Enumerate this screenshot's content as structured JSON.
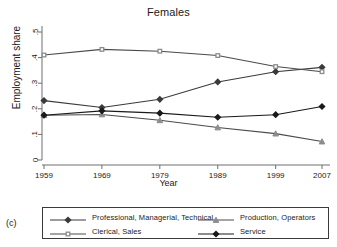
{
  "figure": {
    "panel_title": "Females",
    "corner_label": "(c)",
    "ylabel": "Employment share",
    "xlabel": "Year"
  },
  "colors": {
    "professional": "#3a3a3a",
    "clerical": "#8c8c8c",
    "production": "#8c8c8c",
    "service": "#1a1a1a",
    "axis": "#6e6e6e",
    "text": "#1a1a1a",
    "legend_border": "#3a3a3a",
    "background": "#ffffff"
  },
  "legend": {
    "entries": [
      {
        "label": "Professional, Managerial, Technical",
        "marker": "filled-diamond",
        "color": "#3a3a3a"
      },
      {
        "label": "Clerical, Sales",
        "marker": "open-square",
        "color": "#8c8c8c"
      },
      {
        "label": "Production, Operators",
        "marker": "triangle",
        "color": "#8c8c8c"
      },
      {
        "label": "Service",
        "marker": "filled-diamond",
        "color": "#1a1a1a"
      }
    ]
  },
  "chart_data": {
    "type": "line",
    "title": "Females",
    "xlabel": "Year",
    "ylabel": "Employment share",
    "x": [
      1959,
      1969,
      1979,
      1989,
      1999,
      2007
    ],
    "xticklabels": [
      "1959",
      "1969",
      "1979",
      "1989",
      "1999",
      "2007"
    ],
    "yticklabels": [
      "0",
      ".1",
      ".2",
      ".3",
      ".4",
      ".5"
    ],
    "ylim": [
      0,
      0.55
    ],
    "yticks": [
      0,
      0.1,
      0.2,
      0.3,
      0.4,
      0.5
    ],
    "xlim": [
      1957,
      2009
    ],
    "grid": false,
    "legend_position": "below",
    "series": [
      {
        "name": "Professional, Managerial, Technical",
        "marker": "filled-diamond",
        "color": "#3a3a3a",
        "values": [
          0.232,
          0.205,
          0.237,
          0.305,
          0.345,
          0.362
        ]
      },
      {
        "name": "Clerical, Sales",
        "marker": "open-square",
        "color": "#8c8c8c",
        "values": [
          0.41,
          0.432,
          0.425,
          0.408,
          0.365,
          0.345
        ]
      },
      {
        "name": "Production, Operators",
        "marker": "triangle",
        "color": "#8c8c8c",
        "values": [
          0.175,
          0.178,
          0.155,
          0.127,
          0.103,
          0.072
        ]
      },
      {
        "name": "Service",
        "marker": "filled-diamond",
        "color": "#1a1a1a",
        "values": [
          0.175,
          0.192,
          0.183,
          0.167,
          0.177,
          0.209
        ]
      }
    ]
  }
}
